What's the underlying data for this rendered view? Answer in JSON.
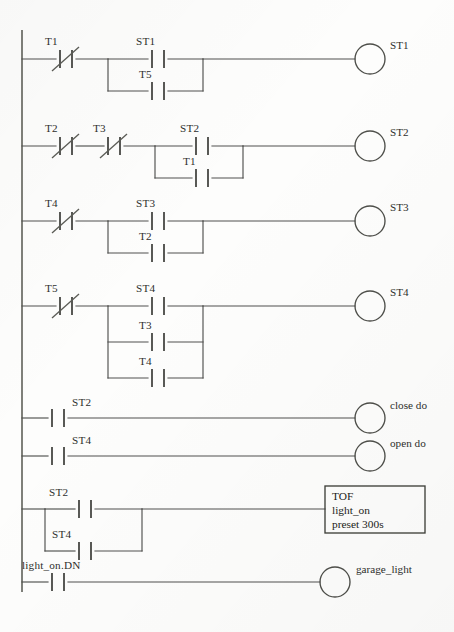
{
  "diagram": {
    "type": "plc-ladder-logic",
    "symbols": {
      "normally_open": "no-contact",
      "normally_closed": "nc-contact",
      "coil": "coil-circle",
      "timer_block": "tof-timer-box"
    },
    "rungs": [
      {
        "id": "rung-1",
        "series": [
          {
            "label": "T1",
            "type": "nc-contact"
          }
        ],
        "branches": [
          {
            "label": "ST1",
            "type": "no-contact"
          },
          {
            "label": "T5",
            "type": "no-contact"
          }
        ],
        "output": {
          "label": "ST1",
          "type": "coil"
        }
      },
      {
        "id": "rung-2",
        "series": [
          {
            "label": "T2",
            "type": "nc-contact"
          },
          {
            "label": "T3",
            "type": "nc-contact"
          }
        ],
        "branches": [
          {
            "label": "ST2",
            "type": "no-contact"
          },
          {
            "label": "T1",
            "type": "no-contact"
          }
        ],
        "output": {
          "label": "ST2",
          "type": "coil"
        }
      },
      {
        "id": "rung-3",
        "series": [
          {
            "label": "T4",
            "type": "nc-contact"
          }
        ],
        "branches": [
          {
            "label": "ST3",
            "type": "no-contact"
          },
          {
            "label": "T2",
            "type": "no-contact"
          }
        ],
        "output": {
          "label": "ST3",
          "type": "coil"
        }
      },
      {
        "id": "rung-4",
        "series": [
          {
            "label": "T5",
            "type": "nc-contact"
          }
        ],
        "branches": [
          {
            "label": "ST4",
            "type": "no-contact"
          },
          {
            "label": "T3",
            "type": "no-contact"
          },
          {
            "label": "T4",
            "type": "no-contact"
          }
        ],
        "output": {
          "label": "ST4",
          "type": "coil"
        }
      },
      {
        "id": "rung-5",
        "series": [
          {
            "label": "ST2",
            "type": "no-contact"
          }
        ],
        "branches": [],
        "output": {
          "label": "close do",
          "type": "coil"
        }
      },
      {
        "id": "rung-6",
        "series": [
          {
            "label": "ST4",
            "type": "no-contact"
          }
        ],
        "branches": [],
        "output": {
          "label": "open do",
          "type": "coil"
        }
      },
      {
        "id": "rung-7",
        "series": [],
        "branches": [
          {
            "label": "ST2",
            "type": "no-contact"
          },
          {
            "label": "ST4",
            "type": "no-contact"
          }
        ],
        "output": {
          "type": "tof-timer",
          "line1": "TOF",
          "line2": "light_on",
          "line3": "preset 300s"
        }
      },
      {
        "id": "rung-8",
        "series": [
          {
            "label": "light_on.DN",
            "type": "no-contact"
          }
        ],
        "branches": [],
        "output": {
          "label": "garage_light",
          "type": "coil"
        }
      }
    ],
    "labels": {
      "r1_c1": "T1",
      "r1_b1": "ST1",
      "r1_b2": "T5",
      "r1_out": "ST1",
      "r2_c1": "T2",
      "r2_c2": "T3",
      "r2_b1": "ST2",
      "r2_b2": "T1",
      "r2_out": "ST2",
      "r3_c1": "T4",
      "r3_b1": "ST3",
      "r3_b2": "T2",
      "r3_out": "ST3",
      "r4_c1": "T5",
      "r4_b1": "ST4",
      "r4_b2": "T3",
      "r4_b3": "T4",
      "r4_out": "ST4",
      "r5_c1": "ST2",
      "r5_out": "close do",
      "r6_c1": "ST4",
      "r6_out": "open do",
      "r7_b1": "ST2",
      "r7_b2": "ST4",
      "r7_tof_1": "TOF",
      "r7_tof_2": "light_on",
      "r7_tof_3": "preset 300s",
      "r8_c1": "light_on.DN",
      "r8_out": "garage_light"
    },
    "colors": {
      "background": "#fdfdfc",
      "wire": "#50514e",
      "text": "#2e2f2c"
    }
  }
}
